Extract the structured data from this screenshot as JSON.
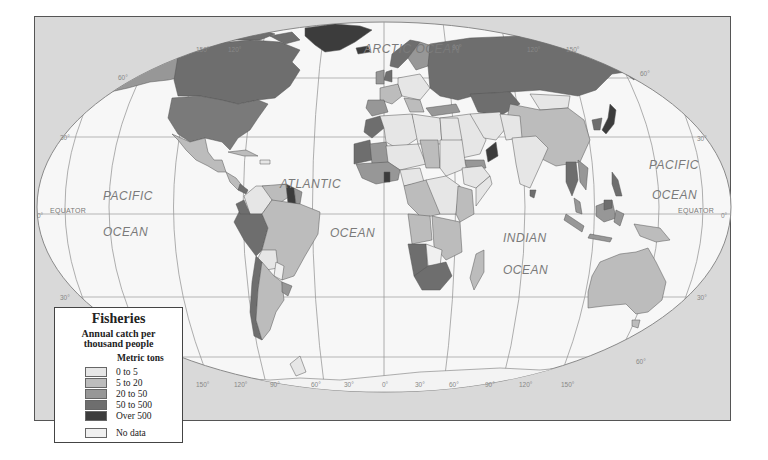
{
  "legend": {
    "title": "Fisheries",
    "subtitle_line1": "Annual catch per",
    "subtitle_line2": "thousand people",
    "unit": "Metric tons",
    "classes": [
      {
        "label": "0 to 5",
        "color": "#e6e6e6"
      },
      {
        "label": "5 to 20",
        "color": "#bcbcbc"
      },
      {
        "label": "20 to 50",
        "color": "#979797"
      },
      {
        "label": "50 to 500",
        "color": "#6e6e6e"
      },
      {
        "label": "Over 500",
        "color": "#3c3c3c"
      }
    ],
    "no_data": {
      "label": "No data",
      "color": "#f0f0f0"
    }
  },
  "labels": {
    "arctic": "ARCTIC OCEAN",
    "pacific_west_1": "PACIFIC",
    "pacific_west_2": "OCEAN",
    "atlantic_1": "ATLANTIC",
    "atlantic_2": "OCEAN",
    "indian_1": "INDIAN",
    "indian_2": "OCEAN",
    "pacific_east_1": "PACIFIC",
    "pacific_east_2": "OCEAN",
    "equator_west": "EQUATOR",
    "equator_east": "EQUATOR"
  },
  "latitude_labels": {
    "n60_west": "60°",
    "n30_west": "30°",
    "eq_west": "0°",
    "s30_west": "30°",
    "n60_east": "60°",
    "n30_east": "30°",
    "eq_east": "0°",
    "s30_east": "30°",
    "s60_east": "60°"
  },
  "longitude_labels": {
    "top": [
      "150°",
      "120°",
      "90°",
      "120°",
      "150°"
    ],
    "bottom": [
      "150°",
      "120°",
      "90°",
      "60°",
      "30°",
      "0°",
      "30°",
      "60°",
      "90°",
      "120°",
      "150°"
    ]
  },
  "colors": {
    "frame_bg": "#d9d9d9",
    "ocean": "#f7f7f7",
    "graticule": "#9a9a9a",
    "border": "#666666"
  }
}
